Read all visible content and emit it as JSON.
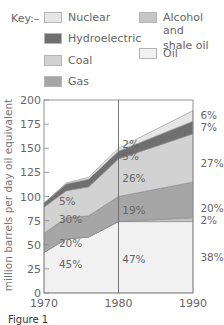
{
  "legend": {
    "key_label": "Key:–",
    "items": [
      {
        "label": "Nuclear",
        "color": "#e6e6e6"
      },
      {
        "label": "Hydroelectric",
        "color": "#6f6f6f"
      },
      {
        "label": "Coal",
        "color": "#d2d2d2"
      },
      {
        "label": "Gas",
        "color": "#a6a6a6"
      },
      {
        "label": "Alcohol and shale oil",
        "label_line1": "Alcohol and",
        "label_line2": "shale oil",
        "color": "#c4c4c4"
      },
      {
        "label": "Oil",
        "color": "#f1f1f1"
      }
    ]
  },
  "caption": "Figure 1",
  "chart_data": {
    "type": "area",
    "stacked": true,
    "title": "",
    "xlabel": "",
    "ylabel": "million barrels per day oil equivalent",
    "x": [
      1970,
      1973,
      1976,
      1980,
      1990
    ],
    "xticks": [
      "1970",
      "1980",
      "1990"
    ],
    "yticks": [
      0,
      25,
      50,
      75,
      100,
      125,
      150,
      175,
      200
    ],
    "ylim": [
      0,
      200
    ],
    "xlim": [
      1970,
      1990
    ],
    "grid": false,
    "vertical_marker": 1980,
    "series": [
      {
        "name": "Oil",
        "values": [
          42,
          56,
          58,
          74,
          74
        ]
      },
      {
        "name": "Alcohol and shale oil",
        "values": [
          0,
          0,
          0,
          0,
          4
        ]
      },
      {
        "name": "Gas",
        "values": [
          20,
          22,
          22,
          26,
          37
        ]
      },
      {
        "name": "Coal",
        "values": [
          27,
          28,
          30,
          39,
          50
        ]
      },
      {
        "name": "Hydroelectric",
        "values": [
          4,
          7,
          8,
          8,
          13
        ]
      },
      {
        "name": "Nuclear",
        "values": [
          0,
          1,
          2,
          3,
          11
        ]
      }
    ],
    "annotations": [
      {
        "text": "45%",
        "x": 1972,
        "y": 30,
        "series": "Oil"
      },
      {
        "text": "20%",
        "x": 1972,
        "y": 52,
        "series": "Gas"
      },
      {
        "text": "30%",
        "x": 1972,
        "y": 77,
        "series": "Coal"
      },
      {
        "text": "5%",
        "x": 1972,
        "y": 95,
        "series": "Hydroelectric"
      },
      {
        "text": "47%",
        "x": 1980.5,
        "y": 35,
        "series": "Oil"
      },
      {
        "text": "19%",
        "x": 1980.5,
        "y": 86,
        "series": "Gas"
      },
      {
        "text": "26%",
        "x": 1980.5,
        "y": 119,
        "series": "Coal"
      },
      {
        "text": "5%",
        "x": 1980.5,
        "y": 142,
        "series": "Hydroelectric"
      },
      {
        "text": "2%",
        "x": 1980.5,
        "y": 154,
        "series": "Nuclear"
      },
      {
        "text": "38%",
        "x": 1991,
        "y": 37,
        "series": "Oil"
      },
      {
        "text": "2%",
        "x": 1991,
        "y": 76,
        "series": "Alcohol and shale oil"
      },
      {
        "text": "20%",
        "x": 1991,
        "y": 88,
        "series": "Gas"
      },
      {
        "text": "27%",
        "x": 1991,
        "y": 135,
        "series": "Coal"
      },
      {
        "text": "7%",
        "x": 1991,
        "y": 172,
        "series": "Hydroelectric"
      },
      {
        "text": "6%",
        "x": 1991,
        "y": 184,
        "series": "Nuclear"
      }
    ]
  }
}
